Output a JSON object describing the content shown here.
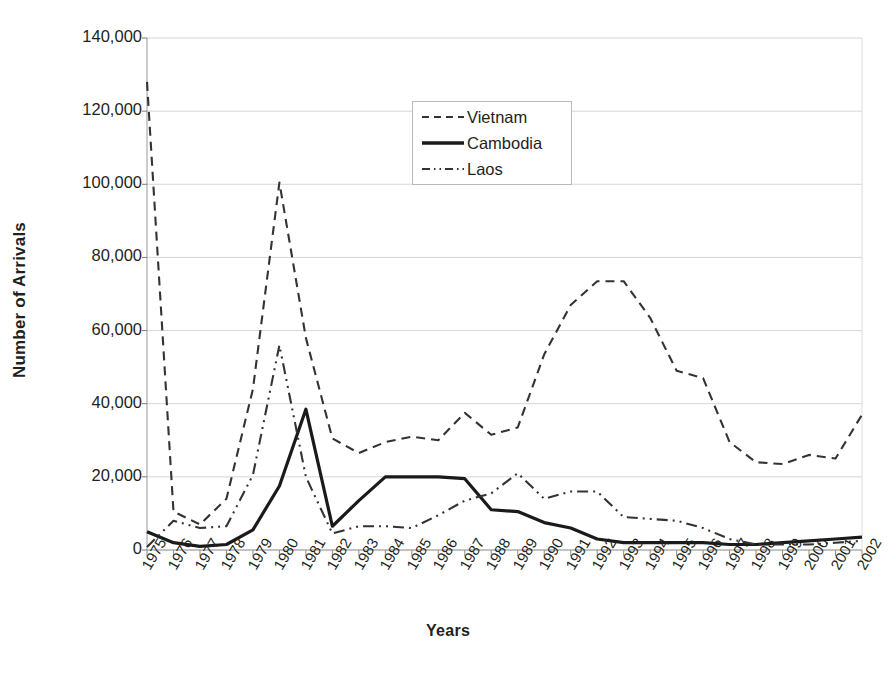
{
  "chart_data": {
    "type": "line",
    "title": "",
    "xlabel": "Years",
    "ylabel": "Number of Arrivals",
    "ylim": [
      0,
      140000
    ],
    "yticks": [
      "0",
      "20,000",
      "40,000",
      "60,000",
      "80,000",
      "100,000",
      "120,000",
      "140,000"
    ],
    "ytick_values": [
      0,
      20000,
      40000,
      60000,
      80000,
      100000,
      120000,
      140000
    ],
    "grid": true,
    "legend_position": "upper-center",
    "categories": [
      "1975",
      "1976",
      "1977",
      "1978",
      "1979",
      "1980",
      "1981",
      "1982",
      "1983",
      "1984",
      "1985",
      "1986",
      "1987",
      "1988",
      "1989",
      "1990",
      "1991",
      "1992",
      "1993",
      "1994",
      "1995",
      "1996",
      "1997",
      "1998",
      "1999",
      "2000",
      "2001",
      "2002"
    ],
    "series": [
      {
        "name": "Vietnam",
        "style": "dashed",
        "color": "#333333",
        "values": [
          128000,
          10500,
          7000,
          14000,
          44000,
          100500,
          58000,
          30500,
          26500,
          29500,
          31000,
          30000,
          37500,
          31500,
          33500,
          53500,
          67000,
          73500,
          73500,
          63500,
          49000,
          47000,
          29500,
          24000,
          23500,
          26000,
          25000,
          37000
        ]
      },
      {
        "name": "Cambodia",
        "style": "solid",
        "color": "#1a1a1a",
        "values": [
          5000,
          2000,
          1000,
          1500,
          5500,
          17500,
          38500,
          6500,
          13500,
          20000,
          20000,
          20000,
          19500,
          11000,
          10500,
          7500,
          6000,
          3000,
          2000,
          2000,
          2000,
          2000,
          1500,
          1500,
          2000,
          2500,
          3000,
          3500
        ]
      },
      {
        "name": "Laos",
        "style": "dashdot",
        "color": "#333333",
        "values": [
          800,
          8000,
          6000,
          6500,
          20500,
          56000,
          20000,
          4500,
          6500,
          6500,
          6000,
          9500,
          13500,
          15500,
          21000,
          14000,
          16000,
          16000,
          9000,
          8500,
          8000,
          6000,
          3000,
          1500,
          1500,
          1500,
          2000,
          2500
        ]
      }
    ]
  },
  "legend": {
    "entries": [
      {
        "label": "Vietnam"
      },
      {
        "label": "Cambodia"
      },
      {
        "label": "Laos"
      }
    ]
  }
}
